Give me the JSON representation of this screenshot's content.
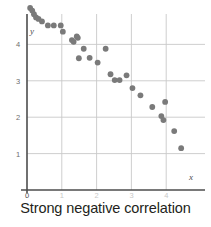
{
  "caption": "Strong negative correlation",
  "axis_labels": {
    "x": "x",
    "y": "y"
  },
  "colors": {
    "point": "#7a7a7a",
    "axis": "#4d4d4d",
    "grid": "#c8c8c8",
    "tick_label": "#6e6e6e",
    "caption": "#231f20"
  },
  "chart_data": {
    "type": "scatter",
    "title": "",
    "subtitle": "",
    "xlabel": "x",
    "ylabel": "y",
    "xlim": [
      0,
      4.9
    ],
    "ylim": [
      0,
      5.2
    ],
    "grid": true,
    "legend": null,
    "annotations": [
      "Strong negative correlation"
    ],
    "xticks": [
      0,
      1,
      2,
      3,
      4
    ],
    "xtick_labels": [
      "0",
      "1",
      "2",
      "3",
      "4"
    ],
    "yticks": [
      1,
      2,
      3,
      4
    ],
    "ytick_labels": [
      "1",
      "2",
      "3",
      "4"
    ],
    "series": [
      {
        "name": "observations",
        "marker": "circle",
        "color": "#7a7a7a",
        "points": [
          [
            0.09,
            5.0
          ],
          [
            0.15,
            4.93
          ],
          [
            0.2,
            4.83
          ],
          [
            0.26,
            4.74
          ],
          [
            0.33,
            4.7
          ],
          [
            0.43,
            4.63
          ],
          [
            0.6,
            4.52
          ],
          [
            0.77,
            4.52
          ],
          [
            0.97,
            4.52
          ],
          [
            1.03,
            4.35
          ],
          [
            1.29,
            4.12
          ],
          [
            1.34,
            4.07
          ],
          [
            1.43,
            4.22
          ],
          [
            1.46,
            4.18
          ],
          [
            1.49,
            3.62
          ],
          [
            1.63,
            3.88
          ],
          [
            1.8,
            3.63
          ],
          [
            2.03,
            3.5
          ],
          [
            2.26,
            3.88
          ],
          [
            2.4,
            3.18
          ],
          [
            2.52,
            3.02
          ],
          [
            2.66,
            3.02
          ],
          [
            2.86,
            3.15
          ],
          [
            3.03,
            2.8
          ],
          [
            3.26,
            2.6
          ],
          [
            3.6,
            2.28
          ],
          [
            3.86,
            2.03
          ],
          [
            3.92,
            1.92
          ],
          [
            3.97,
            2.42
          ],
          [
            4.23,
            1.62
          ],
          [
            4.43,
            1.15
          ]
        ]
      }
    ]
  },
  "geometry": {
    "origin_px": {
      "x": 27,
      "y": 190
    },
    "unit_px": {
      "x": 34.8,
      "y": 36.4
    },
    "point_radius_px": 2.9
  }
}
